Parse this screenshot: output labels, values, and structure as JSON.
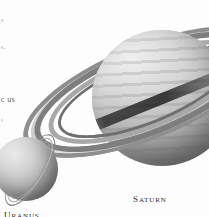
{
  "page": {
    "kind": "astronomy-illustration",
    "background_color": "#fdfdfd",
    "palette": {
      "ink": "#2e2e2e",
      "planet_light": "#efefef",
      "planet_mid": "#b4b4b4",
      "planet_dark": "#636363",
      "ring_light": "#ffffff",
      "ring_mid": "#a8a8a8",
      "ring_dark": "#6f6f6f",
      "shadow": "#1e1e1e"
    }
  },
  "margin_text": {
    "fragment_1": "e",
    "fragment_2": "s,",
    "fragment_3": "c us",
    "fragment_4": "s"
  },
  "planets": [
    {
      "id": "saturn",
      "label_lead": "S",
      "label_rest": "ATURN",
      "label_full": "SATURN",
      "has_rings": true,
      "ring_count": 6,
      "ring_tilt_deg": -22,
      "position": "upper-right",
      "cropped": true
    },
    {
      "id": "uranus",
      "label_lead": "U",
      "label_rest": "RANUS",
      "label_full": "URANUS",
      "has_rings": true,
      "ring_count": 3,
      "ring_tilt_deg": -58,
      "position": "lower-left",
      "cropped": true
    }
  ]
}
